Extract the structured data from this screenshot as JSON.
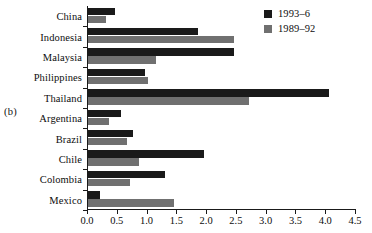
{
  "panel": {
    "label": "(b)"
  },
  "legend": {
    "position": "top-right",
    "entries": [
      {
        "label": "1993–6",
        "color": "#1a1a1a",
        "swatch_name": "legend-swatch-1993-6"
      },
      {
        "label": "1989–92",
        "color": "#707070",
        "swatch_name": "legend-swatch-1989-92"
      }
    ]
  },
  "chart_data": {
    "type": "bar",
    "orientation": "horizontal",
    "title": "",
    "subtitle": "",
    "xlabel": "",
    "ylabel": "",
    "xlim": [
      0.0,
      4.5
    ],
    "xticks": [
      "0.0",
      "0.5",
      "1.0",
      "1.5",
      "2.0",
      "2.5",
      "3.0",
      "3.5",
      "4.0",
      "4.5"
    ],
    "xtick_values": [
      0.0,
      0.5,
      1.0,
      1.5,
      2.0,
      2.5,
      3.0,
      3.5,
      4.0,
      4.5
    ],
    "grid": false,
    "categories": [
      "China",
      "Indonesia",
      "Malaysia",
      "Philippines",
      "Thailand",
      "Argentina",
      "Brazil",
      "Chile",
      "Colombia",
      "Mexico"
    ],
    "series": [
      {
        "name": "1993–6",
        "color": "#1a1a1a",
        "values": [
          0.45,
          1.85,
          2.45,
          0.95,
          4.05,
          0.55,
          0.75,
          1.95,
          1.3,
          0.2
        ]
      },
      {
        "name": "1989–92",
        "color": "#707070",
        "values": [
          0.3,
          2.45,
          1.15,
          1.0,
          2.7,
          0.35,
          0.65,
          0.85,
          0.7,
          1.45
        ]
      }
    ]
  }
}
